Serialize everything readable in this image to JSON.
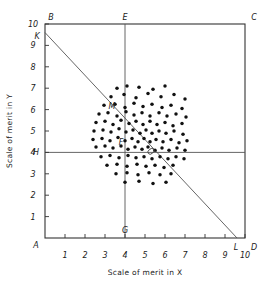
{
  "figure": {
    "xlabel": "Scale of merit in X",
    "ylabel": "Scale of merit in Y"
  },
  "axes": {
    "x_ticks": [
      "1",
      "2",
      "3",
      "4",
      "5",
      "6",
      "7",
      "8",
      "9",
      "10"
    ],
    "y_ticks": [
      "1",
      "2",
      "3",
      "4",
      "5",
      "6",
      "7",
      "8",
      "9",
      "10"
    ]
  },
  "corners": {
    "A": "A",
    "B": "B",
    "C": "C",
    "D": "D",
    "E": "E",
    "G": "G",
    "H": "H",
    "K": "K",
    "L": "L",
    "M": "M",
    "F": "F"
  },
  "chart_data": {
    "type": "scatter",
    "title": "",
    "xlabel": "Scale of merit in X",
    "ylabel": "Scale of merit in Y",
    "xlim": [
      0,
      10
    ],
    "ylim": [
      0,
      10
    ],
    "grid": false,
    "legend": null,
    "annotations": [
      {
        "label": "A",
        "x": 0,
        "y": 0,
        "note": "origin corner of frame"
      },
      {
        "label": "B",
        "x": 0,
        "y": 10,
        "note": "top-left corner of frame"
      },
      {
        "label": "C",
        "x": 10,
        "y": 10,
        "note": "top-right corner of frame"
      },
      {
        "label": "D",
        "x": 10,
        "y": 0,
        "note": "bottom-right corner of frame"
      },
      {
        "label": "E",
        "x": 4.0,
        "y": 10,
        "note": "top end of vertical mean line"
      },
      {
        "label": "G",
        "x": 4.0,
        "y": 0,
        "note": "bottom end of vertical mean line"
      },
      {
        "label": "H",
        "x": 0,
        "y": 4.0,
        "note": "left end of horizontal mean line"
      },
      {
        "label": "K",
        "x": 0,
        "y": 9.6,
        "note": "left end of regression diagonal"
      },
      {
        "label": "L",
        "x": 9.6,
        "y": 0,
        "note": "right end of regression diagonal"
      },
      {
        "label": "M",
        "x": 3.65,
        "y": 5.95,
        "note": "point on diagonal left of centroid"
      },
      {
        "label": "F",
        "x": 4.1,
        "y": 4.35,
        "note": "near intersection of mean lines"
      }
    ],
    "reference_lines": [
      {
        "name": "vertical-mean-line",
        "x": 4.0,
        "from_y": 0,
        "to_y": 10
      },
      {
        "name": "horizontal-mean-line",
        "y": 4.0,
        "from_x": 0,
        "to_x": 10
      },
      {
        "name": "regression-diagonal",
        "from": [
          0,
          9.6
        ],
        "to": [
          9.6,
          0
        ]
      }
    ],
    "centroid_marker": {
      "x": 5.3,
      "y": 4.05,
      "shape": "ellipse"
    },
    "points": [
      [
        3.6,
        7.0
      ],
      [
        4.1,
        7.1
      ],
      [
        4.7,
        7.05
      ],
      [
        5.4,
        6.95
      ],
      [
        6.0,
        7.1
      ],
      [
        3.3,
        6.6
      ],
      [
        3.95,
        6.7
      ],
      [
        4.55,
        6.55
      ],
      [
        5.15,
        6.75
      ],
      [
        5.8,
        6.6
      ],
      [
        6.45,
        6.7
      ],
      [
        7.0,
        6.5
      ],
      [
        2.95,
        6.2
      ],
      [
        3.5,
        6.25
      ],
      [
        4.0,
        6.1
      ],
      [
        4.45,
        6.3
      ],
      [
        4.9,
        6.15
      ],
      [
        5.35,
        6.25
      ],
      [
        5.85,
        6.1
      ],
      [
        6.3,
        6.2
      ],
      [
        6.85,
        6.05
      ],
      [
        2.7,
        5.8
      ],
      [
        3.15,
        5.85
      ],
      [
        3.6,
        5.7
      ],
      [
        4.05,
        5.9
      ],
      [
        4.45,
        5.75
      ],
      [
        4.85,
        5.85
      ],
      [
        5.25,
        5.7
      ],
      [
        5.7,
        5.85
      ],
      [
        6.1,
        5.7
      ],
      [
        6.55,
        5.8
      ],
      [
        7.05,
        5.65
      ],
      [
        2.55,
        5.4
      ],
      [
        3.0,
        5.45
      ],
      [
        3.4,
        5.3
      ],
      [
        3.8,
        5.5
      ],
      [
        4.2,
        5.35
      ],
      [
        4.55,
        5.45
      ],
      [
        4.9,
        5.3
      ],
      [
        5.25,
        5.45
      ],
      [
        5.6,
        5.3
      ],
      [
        6.0,
        5.4
      ],
      [
        6.4,
        5.25
      ],
      [
        6.85,
        5.35
      ],
      [
        2.45,
        5.0
      ],
      [
        2.9,
        5.05
      ],
      [
        3.3,
        4.95
      ],
      [
        3.7,
        5.1
      ],
      [
        4.05,
        4.95
      ],
      [
        4.4,
        5.05
      ],
      [
        4.75,
        4.9
      ],
      [
        5.05,
        5.05
      ],
      [
        5.35,
        4.9
      ],
      [
        5.7,
        5.0
      ],
      [
        6.05,
        4.9
      ],
      [
        6.45,
        5.0
      ],
      [
        6.9,
        4.85
      ],
      [
        2.4,
        4.6
      ],
      [
        2.85,
        4.65
      ],
      [
        3.25,
        4.55
      ],
      [
        3.65,
        4.7
      ],
      [
        4.0,
        4.55
      ],
      [
        4.35,
        4.65
      ],
      [
        4.65,
        4.5
      ],
      [
        4.95,
        4.65
      ],
      [
        5.25,
        4.5
      ],
      [
        5.55,
        4.6
      ],
      [
        5.9,
        4.5
      ],
      [
        6.3,
        4.6
      ],
      [
        6.7,
        4.45
      ],
      [
        7.1,
        4.55
      ],
      [
        2.55,
        4.25
      ],
      [
        3.0,
        4.3
      ],
      [
        3.4,
        4.2
      ],
      [
        3.8,
        4.3
      ],
      [
        4.15,
        4.15
      ],
      [
        4.5,
        4.25
      ],
      [
        4.85,
        4.15
      ],
      [
        5.15,
        4.25
      ],
      [
        5.5,
        4.1
      ],
      [
        5.85,
        4.2
      ],
      [
        6.2,
        4.1
      ],
      [
        6.6,
        4.2
      ],
      [
        7.0,
        4.1
      ],
      [
        2.8,
        3.8
      ],
      [
        3.25,
        3.85
      ],
      [
        3.7,
        3.75
      ],
      [
        4.15,
        3.85
      ],
      [
        4.55,
        3.75
      ],
      [
        4.95,
        3.8
      ],
      [
        5.35,
        3.7
      ],
      [
        5.75,
        3.8
      ],
      [
        6.15,
        3.7
      ],
      [
        6.55,
        3.8
      ],
      [
        6.95,
        3.7
      ],
      [
        3.1,
        3.4
      ],
      [
        3.6,
        3.45
      ],
      [
        4.1,
        3.35
      ],
      [
        4.6,
        3.45
      ],
      [
        5.05,
        3.35
      ],
      [
        5.5,
        3.4
      ],
      [
        5.95,
        3.3
      ],
      [
        6.4,
        3.4
      ],
      [
        3.55,
        3.0
      ],
      [
        4.1,
        3.05
      ],
      [
        4.65,
        2.95
      ],
      [
        5.2,
        3.05
      ],
      [
        5.75,
        2.95
      ],
      [
        6.3,
        3.0
      ],
      [
        4.0,
        2.6
      ],
      [
        4.7,
        2.65
      ],
      [
        5.4,
        2.55
      ],
      [
        6.05,
        2.6
      ]
    ]
  }
}
